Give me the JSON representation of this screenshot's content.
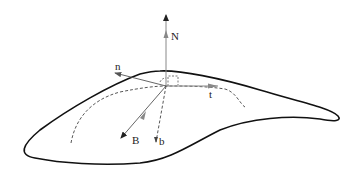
{
  "diagram": {
    "labels": {
      "N": "N",
      "n": "n",
      "t": "t",
      "B": "B",
      "b": "b"
    },
    "colors": {
      "surface_outline": "#111111",
      "vector_gray": "#888888",
      "dashed": "#444444",
      "text": "#222222"
    }
  }
}
